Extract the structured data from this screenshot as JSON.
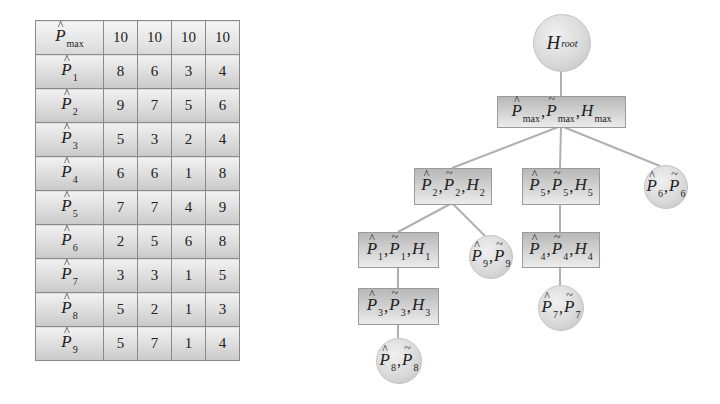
{
  "table": {
    "rows": [
      {
        "symbol": "P",
        "accent": "hat",
        "sub": "max",
        "values": [
          "10",
          "10",
          "10",
          "10"
        ]
      },
      {
        "symbol": "P",
        "accent": "hat",
        "sub": "1",
        "values": [
          "8",
          "6",
          "3",
          "4"
        ]
      },
      {
        "symbol": "P",
        "accent": "hat",
        "sub": "2",
        "values": [
          "9",
          "7",
          "5",
          "6"
        ]
      },
      {
        "symbol": "P",
        "accent": "hat",
        "sub": "3",
        "values": [
          "5",
          "3",
          "2",
          "4"
        ]
      },
      {
        "symbol": "P",
        "accent": "hat",
        "sub": "4",
        "values": [
          "6",
          "6",
          "1",
          "8"
        ]
      },
      {
        "symbol": "P",
        "accent": "hat",
        "sub": "5",
        "values": [
          "7",
          "7",
          "4",
          "9"
        ]
      },
      {
        "symbol": "P",
        "accent": "hat",
        "sub": "6",
        "values": [
          "2",
          "5",
          "6",
          "8"
        ]
      },
      {
        "symbol": "P",
        "accent": "hat",
        "sub": "7",
        "values": [
          "3",
          "3",
          "1",
          "5"
        ]
      },
      {
        "symbol": "P",
        "accent": "hat",
        "sub": "8",
        "values": [
          "5",
          "2",
          "1",
          "3"
        ]
      },
      {
        "symbol": "P",
        "accent": "hat",
        "sub": "9",
        "values": [
          "5",
          "7",
          "1",
          "4"
        ]
      }
    ]
  },
  "tree": {
    "glyphs": {
      "hat": "^",
      "tilde": "~",
      "comma": ",",
      "P": "P",
      "H": "H"
    },
    "root": {
      "label": "H",
      "sub": "root"
    },
    "nodes": {
      "max": {
        "sub": "max",
        "type": "box"
      },
      "n2": {
        "sub": "2",
        "type": "box"
      },
      "n5": {
        "sub": "5",
        "type": "box"
      },
      "n6": {
        "sub": "6",
        "type": "circle"
      },
      "n1": {
        "sub": "1",
        "type": "box"
      },
      "n9": {
        "sub": "9",
        "type": "circle"
      },
      "n4": {
        "sub": "4",
        "type": "box"
      },
      "n3": {
        "sub": "3",
        "type": "box"
      },
      "n7": {
        "sub": "7",
        "type": "circle"
      },
      "n8": {
        "sub": "8",
        "type": "circle"
      }
    },
    "edges": [
      [
        "root",
        "max"
      ],
      [
        "max",
        "n2"
      ],
      [
        "max",
        "n5"
      ],
      [
        "max",
        "n6"
      ],
      [
        "n2",
        "n1"
      ],
      [
        "n2",
        "n9"
      ],
      [
        "n5",
        "n4"
      ],
      [
        "n1",
        "n3"
      ],
      [
        "n4",
        "n7"
      ],
      [
        "n3",
        "n8"
      ]
    ]
  }
}
